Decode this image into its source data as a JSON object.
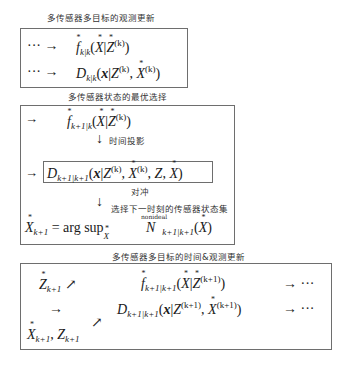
{
  "section1": {
    "title": "多传感器多目标的观测更新",
    "rows": [
      {
        "prefix": "··· →",
        "expr_name": "f_k|k(X|Z^(k))"
      },
      {
        "prefix": "··· →",
        "expr_name": "D_k|k(x|Z^(k), X^(k))"
      }
    ]
  },
  "section2": {
    "title": "多传感器状态的最优选择",
    "row1_prefix": "→",
    "step1_label": "时间投影",
    "row2_prefix": "→",
    "step2_label": "对冲",
    "step3_label": "选择下一时刻的传感器状态集",
    "nonideal_label": "nonideal",
    "argsup_text": "= arg sup"
  },
  "section3": {
    "title": "多传感器多目标的时间&观测更新",
    "row1_trail": "→ ···",
    "row2_lead": "→",
    "row2_trail": "→ ···"
  }
}
